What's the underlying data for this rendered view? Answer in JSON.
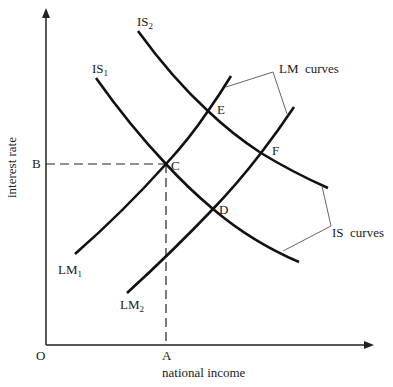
{
  "diagram": {
    "type": "IS-LM diagram",
    "axes": {
      "x_label": "national income",
      "y_label": "interest rate",
      "origin_label": "O",
      "x_marker_label": "A",
      "y_marker_label": "B"
    },
    "curves": {
      "is1": {
        "label": "IS",
        "sub": "1"
      },
      "is2": {
        "label": "IS",
        "sub": "2"
      },
      "lm1": {
        "label": "LM",
        "sub": "1"
      },
      "lm2": {
        "label": "LM",
        "sub": "2"
      }
    },
    "points": {
      "c": "C",
      "d": "D",
      "e": "E",
      "f": "F"
    },
    "annotations": {
      "lm_group": "LM  curves",
      "is_group": "IS  curves"
    },
    "colors": {
      "curve": "#111111",
      "axis": "#222222",
      "leader": "#555555"
    }
  }
}
